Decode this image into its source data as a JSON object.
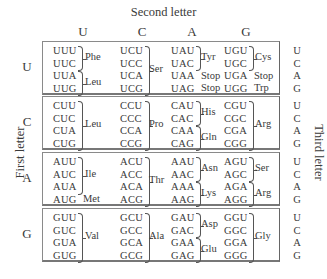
{
  "title": "Second letter",
  "first_letter_label": "First letter",
  "third_letter_label": "Third letter",
  "second_letters": [
    "U",
    "C",
    "A",
    "G"
  ],
  "first_letters": [
    "U",
    "C",
    "A",
    "G"
  ],
  "third_letters": [
    "U",
    "C",
    "A",
    "G"
  ],
  "rows": [
    {
      "first": "U",
      "cols": [
        {
          "codons": [
            "UUU",
            "UUC",
            "UUA",
            "UUG"
          ],
          "groups": [
            {
              "aa": "Phe",
              "from": 0,
              "to": 1
            },
            {
              "aa": "Leu",
              "from": 2,
              "to": 3
            }
          ]
        },
        {
          "codons": [
            "UCU",
            "UCC",
            "UCA",
            "UCG"
          ],
          "groups": [
            {
              "aa": "Ser",
              "from": 0,
              "to": 3
            }
          ]
        },
        {
          "codons": [
            "UAU",
            "UAC",
            "UAA",
            "UAG"
          ],
          "groups": [
            {
              "aa": "Tyr",
              "from": 0,
              "to": 1
            },
            {
              "aa": "Stop",
              "from": 2,
              "to": 2
            },
            {
              "aa": "Stop",
              "from": 3,
              "to": 3
            }
          ]
        },
        {
          "codons": [
            "UGU",
            "UGC",
            "UGA",
            "UGG"
          ],
          "groups": [
            {
              "aa": "Cys",
              "from": 0,
              "to": 1
            },
            {
              "aa": "Stop",
              "from": 2,
              "to": 2
            },
            {
              "aa": "Trp",
              "from": 3,
              "to": 3
            }
          ]
        }
      ]
    },
    {
      "first": "C",
      "cols": [
        {
          "codons": [
            "CUU",
            "CUC",
            "CUA",
            "CUG"
          ],
          "groups": [
            {
              "aa": "Leu",
              "from": 0,
              "to": 3
            }
          ]
        },
        {
          "codons": [
            "CCU",
            "CCC",
            "CCA",
            "CCG"
          ],
          "groups": [
            {
              "aa": "Pro",
              "from": 0,
              "to": 3
            }
          ]
        },
        {
          "codons": [
            "CAU",
            "CAC",
            "CAA",
            "CAG"
          ],
          "groups": [
            {
              "aa": "His",
              "from": 0,
              "to": 1
            },
            {
              "aa": "Gln",
              "from": 2,
              "to": 3
            }
          ]
        },
        {
          "codons": [
            "CGU",
            "CGC",
            "CGA",
            "CGG"
          ],
          "groups": [
            {
              "aa": "Arg",
              "from": 0,
              "to": 3
            }
          ]
        }
      ]
    },
    {
      "first": "A",
      "cols": [
        {
          "codons": [
            "AUU",
            "AUC",
            "AUA",
            "AUG"
          ],
          "groups": [
            {
              "aa": "Ile",
              "from": 0,
              "to": 2
            },
            {
              "aa": "Met",
              "from": 3,
              "to": 3
            }
          ]
        },
        {
          "codons": [
            "ACU",
            "ACC",
            "ACA",
            "ACG"
          ],
          "groups": [
            {
              "aa": "Thr",
              "from": 0,
              "to": 3
            }
          ]
        },
        {
          "codons": [
            "AAU",
            "AAC",
            "AAA",
            "AAG"
          ],
          "groups": [
            {
              "aa": "Asn",
              "from": 0,
              "to": 1
            },
            {
              "aa": "Lys",
              "from": 2,
              "to": 3
            }
          ]
        },
        {
          "codons": [
            "AGU",
            "AGC",
            "AGA",
            "AGG"
          ],
          "groups": [
            {
              "aa": "Ser",
              "from": 0,
              "to": 1
            },
            {
              "aa": "Arg",
              "from": 2,
              "to": 3
            }
          ]
        }
      ]
    },
    {
      "first": "G",
      "cols": [
        {
          "codons": [
            "GUU",
            "GUC",
            "GUA",
            "GUG"
          ],
          "groups": [
            {
              "aa": "Val",
              "from": 0,
              "to": 3
            }
          ]
        },
        {
          "codons": [
            "GCU",
            "GCC",
            "GCA",
            "GCG"
          ],
          "groups": [
            {
              "aa": "Ala",
              "from": 0,
              "to": 3
            }
          ]
        },
        {
          "codons": [
            "GAU",
            "GAC",
            "GAA",
            "GAG"
          ],
          "groups": [
            {
              "aa": "Asp",
              "from": 0,
              "to": 1
            },
            {
              "aa": "Glu",
              "from": 2,
              "to": 3
            }
          ]
        },
        {
          "codons": [
            "GGU",
            "GGC",
            "GGA",
            "GGG"
          ],
          "groups": [
            {
              "aa": "Gly",
              "from": 0,
              "to": 3
            }
          ]
        }
      ]
    }
  ]
}
